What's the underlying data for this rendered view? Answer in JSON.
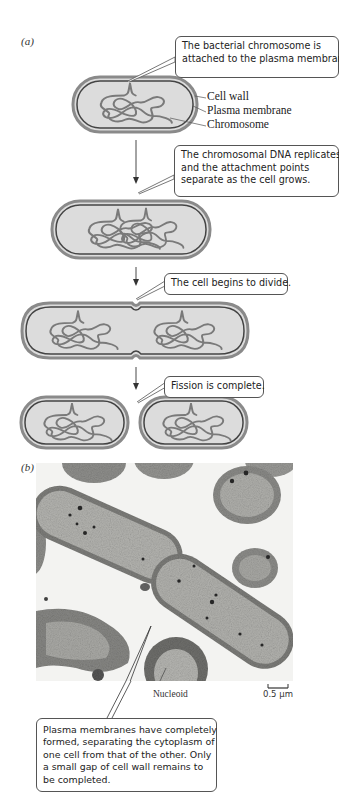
{
  "panel_a": {
    "label": "(a)",
    "steps": [
      {
        "callout": [
          "The bacterial chromosome is",
          "attached to the plasma membrane."
        ]
      },
      {
        "callout": [
          "The chromosomal DNA replicates,",
          "and the attachment points",
          "separate as the cell grows."
        ]
      },
      {
        "callout": [
          "The cell begins to divide."
        ]
      },
      {
        "callout": [
          "Fission is complete."
        ]
      }
    ],
    "cell_labels": {
      "cell_wall": "Cell wall",
      "plasma_membrane": "Plasma membrane",
      "chromosome": "Chromosome"
    }
  },
  "panel_b": {
    "label": "(b)",
    "nucleoid_label": "Nucleoid",
    "scale_bar": "0.5 μm",
    "callout": [
      "Plasma membranes have completely",
      "formed, separating the cytoplasm of",
      "one cell from that of the other. Only",
      "a small gap of cell wall remains to",
      "be completed."
    ]
  },
  "colors": {
    "cell_fill": "#dcdcdc",
    "cell_wall": "#888888",
    "membrane": "#444444",
    "chromosome": "#7a7a7a",
    "callout_border": "#555555"
  }
}
